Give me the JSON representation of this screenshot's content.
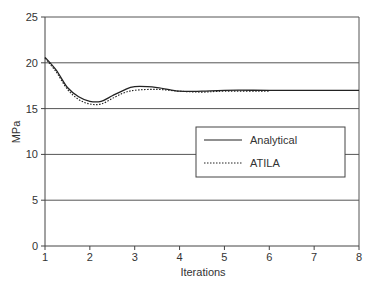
{
  "chart_data": {
    "type": "line",
    "title": "",
    "xlabel": "Iterations",
    "ylabel": "MPa",
    "xlim": [
      1,
      8
    ],
    "ylim": [
      0,
      25
    ],
    "xticks": [
      1,
      2,
      3,
      4,
      5,
      6,
      7,
      8
    ],
    "yticks": [
      0,
      5,
      10,
      15,
      20,
      25
    ],
    "grid": "horizontal",
    "legend_position": "center-right, inside plot",
    "series": [
      {
        "name": "Analytical",
        "style": "solid",
        "x": [
          1,
          1.25,
          1.5,
          1.75,
          2,
          2.25,
          2.5,
          2.75,
          3,
          3.5,
          4,
          4.5,
          5,
          6,
          7,
          8
        ],
        "values": [
          20.6,
          19.2,
          17.3,
          16.3,
          15.8,
          15.8,
          16.4,
          17.0,
          17.4,
          17.3,
          16.9,
          16.9,
          17.0,
          17.0,
          17.0,
          17.0
        ]
      },
      {
        "name": "ATILA",
        "style": "dotted",
        "x": [
          1,
          1.25,
          1.5,
          1.75,
          2,
          2.25,
          2.5,
          2.75,
          3,
          3.5,
          4,
          4.5,
          5,
          6
        ],
        "values": [
          20.5,
          19.0,
          17.1,
          16.0,
          15.5,
          15.5,
          16.1,
          16.7,
          17.0,
          17.1,
          16.9,
          16.8,
          16.9,
          16.9
        ]
      }
    ]
  },
  "colors": {
    "axis": "#444444",
    "grid": "#555555",
    "line": "#222222",
    "text": "#333333"
  }
}
